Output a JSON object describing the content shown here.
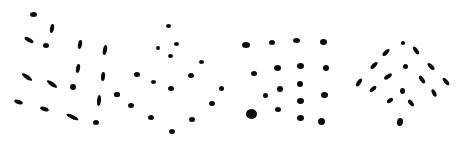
{
  "figure": {
    "background": "#ffffff",
    "ink": "#0b0b0b",
    "panels": [
      {
        "name": "dash-grid-oblique",
        "marks": [
          {
            "x": 33,
            "y": 14,
            "w": 7,
            "h": 5,
            "r": 0
          },
          {
            "x": 52,
            "y": 28,
            "w": 4,
            "h": 9,
            "r": 10
          },
          {
            "x": 29,
            "y": 40,
            "w": 10,
            "h": 4,
            "r": 30
          },
          {
            "x": 46,
            "y": 45,
            "w": 6,
            "h": 5,
            "r": 0
          },
          {
            "x": 80,
            "y": 44,
            "w": 4,
            "h": 9,
            "r": 10
          },
          {
            "x": 105,
            "y": 50,
            "w": 4,
            "h": 10,
            "r": 10
          },
          {
            "x": 27,
            "y": 77,
            "w": 12,
            "h": 4,
            "r": 35
          },
          {
            "x": 52,
            "y": 84,
            "w": 12,
            "h": 4,
            "r": 35
          },
          {
            "x": 73,
            "y": 87,
            "w": 6,
            "h": 6,
            "r": 0
          },
          {
            "x": 78,
            "y": 68,
            "w": 4,
            "h": 9,
            "r": 10
          },
          {
            "x": 103,
            "y": 76,
            "w": 4,
            "h": 9,
            "r": 5
          },
          {
            "x": 117,
            "y": 94,
            "w": 6,
            "h": 5,
            "r": 0
          },
          {
            "x": 18,
            "y": 102,
            "w": 9,
            "h": 4,
            "r": 20
          },
          {
            "x": 44,
            "y": 109,
            "w": 9,
            "h": 4,
            "r": 20
          },
          {
            "x": 72,
            "y": 117,
            "w": 13,
            "h": 4,
            "r": 25
          },
          {
            "x": 99,
            "y": 100,
            "w": 4,
            "h": 11,
            "r": 5
          },
          {
            "x": 96,
            "y": 122,
            "w": 6,
            "h": 5,
            "r": 0
          }
        ]
      },
      {
        "name": "dot-lattice-diamond",
        "marks": [
          {
            "x": 168,
            "y": 26,
            "w": 5,
            "h": 4,
            "r": 0
          },
          {
            "x": 158,
            "y": 48,
            "w": 4,
            "h": 4,
            "r": 0
          },
          {
            "x": 176,
            "y": 44,
            "w": 5,
            "h": 4,
            "r": 0
          },
          {
            "x": 170,
            "y": 56,
            "w": 5,
            "h": 4,
            "r": 0
          },
          {
            "x": 201,
            "y": 62,
            "w": 5,
            "h": 4,
            "r": 0
          },
          {
            "x": 137,
            "y": 74,
            "w": 6,
            "h": 5,
            "r": 0
          },
          {
            "x": 153,
            "y": 82,
            "w": 5,
            "h": 4,
            "r": 0
          },
          {
            "x": 171,
            "y": 88,
            "w": 6,
            "h": 5,
            "r": 0
          },
          {
            "x": 191,
            "y": 75,
            "w": 6,
            "h": 5,
            "r": 0
          },
          {
            "x": 221,
            "y": 88,
            "w": 5,
            "h": 5,
            "r": 0
          },
          {
            "x": 117,
            "y": 94,
            "w": 6,
            "h": 5,
            "r": 0
          },
          {
            "x": 131,
            "y": 105,
            "w": 6,
            "h": 5,
            "r": 0
          },
          {
            "x": 212,
            "y": 103,
            "w": 6,
            "h": 5,
            "r": 0
          },
          {
            "x": 151,
            "y": 117,
            "w": 6,
            "h": 5,
            "r": 0
          },
          {
            "x": 192,
            "y": 119,
            "w": 6,
            "h": 5,
            "r": 0
          },
          {
            "x": 172,
            "y": 131,
            "w": 6,
            "h": 5,
            "r": 0
          }
        ]
      },
      {
        "name": "dot-grid-square",
        "marks": [
          {
            "x": 246,
            "y": 45,
            "w": 8,
            "h": 6,
            "r": 0
          },
          {
            "x": 272,
            "y": 42,
            "w": 6,
            "h": 5,
            "r": 0
          },
          {
            "x": 296,
            "y": 40,
            "w": 7,
            "h": 5,
            "r": 0
          },
          {
            "x": 323,
            "y": 42,
            "w": 7,
            "h": 6,
            "r": 0
          },
          {
            "x": 254,
            "y": 73,
            "w": 6,
            "h": 5,
            "r": 0
          },
          {
            "x": 277,
            "y": 68,
            "w": 7,
            "h": 6,
            "r": 0
          },
          {
            "x": 300,
            "y": 66,
            "w": 7,
            "h": 6,
            "r": 0
          },
          {
            "x": 326,
            "y": 68,
            "w": 6,
            "h": 6,
            "r": 0
          },
          {
            "x": 265,
            "y": 95,
            "w": 5,
            "h": 5,
            "r": 0
          },
          {
            "x": 280,
            "y": 89,
            "w": 6,
            "h": 6,
            "r": 0
          },
          {
            "x": 300,
            "y": 84,
            "w": 6,
            "h": 6,
            "r": 0
          },
          {
            "x": 300,
            "y": 101,
            "w": 7,
            "h": 6,
            "r": 0
          },
          {
            "x": 324,
            "y": 95,
            "w": 7,
            "h": 6,
            "r": 0
          },
          {
            "x": 251,
            "y": 114,
            "w": 11,
            "h": 10,
            "r": 0
          },
          {
            "x": 278,
            "y": 109,
            "w": 6,
            "h": 5,
            "r": 0
          },
          {
            "x": 300,
            "y": 118,
            "w": 7,
            "h": 6,
            "r": 0
          },
          {
            "x": 321,
            "y": 121,
            "w": 7,
            "h": 7,
            "r": 0
          }
        ]
      },
      {
        "name": "dash-chevron",
        "marks": [
          {
            "x": 403,
            "y": 43,
            "w": 4,
            "h": 4,
            "r": 0
          },
          {
            "x": 386,
            "y": 52,
            "w": 4,
            "h": 9,
            "r": 45
          },
          {
            "x": 416,
            "y": 50,
            "w": 4,
            "h": 9,
            "r": -35
          },
          {
            "x": 374,
            "y": 65,
            "w": 4,
            "h": 9,
            "r": 45
          },
          {
            "x": 405,
            "y": 66,
            "w": 5,
            "h": 5,
            "r": 0
          },
          {
            "x": 431,
            "y": 66,
            "w": 4,
            "h": 9,
            "r": -45
          },
          {
            "x": 359,
            "y": 82,
            "w": 4,
            "h": 9,
            "r": 35
          },
          {
            "x": 388,
            "y": 76,
            "w": 4,
            "h": 9,
            "r": 55
          },
          {
            "x": 422,
            "y": 79,
            "w": 4,
            "h": 9,
            "r": -35
          },
          {
            "x": 446,
            "y": 81,
            "w": 4,
            "h": 9,
            "r": -40
          },
          {
            "x": 373,
            "y": 89,
            "w": 4,
            "h": 8,
            "r": 50
          },
          {
            "x": 402,
            "y": 91,
            "w": 5,
            "h": 6,
            "r": 0
          },
          {
            "x": 434,
            "y": 93,
            "w": 4,
            "h": 8,
            "r": -25
          },
          {
            "x": 390,
            "y": 100,
            "w": 4,
            "h": 7,
            "r": 55
          },
          {
            "x": 411,
            "y": 103,
            "w": 4,
            "h": 8,
            "r": -40
          },
          {
            "x": 400,
            "y": 122,
            "w": 6,
            "h": 8,
            "r": 10
          }
        ]
      }
    ]
  }
}
